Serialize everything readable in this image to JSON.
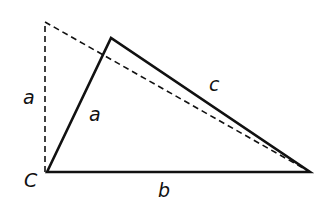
{
  "diagram": {
    "title": "",
    "colors": {
      "line": "#111111",
      "background": "#ffffff"
    },
    "vertices": {
      "C": {
        "label": "C",
        "x": 47,
        "y": 172
      },
      "top": {
        "x": 111,
        "y": 38
      },
      "right": {
        "x": 310,
        "y": 172
      },
      "dashed_apex": {
        "x": 45,
        "y": 22
      }
    },
    "labels": {
      "vertex_c": "C",
      "side_a_dashed": "a",
      "side_a": "a",
      "side_b": "b",
      "side_c": "c"
    },
    "solid_triangle": {
      "sides": [
        "a",
        "b",
        "c"
      ]
    },
    "dashed_right_triangle": {
      "legs": [
        "a",
        "b"
      ],
      "note": "leg a drawn vertically at C"
    }
  }
}
